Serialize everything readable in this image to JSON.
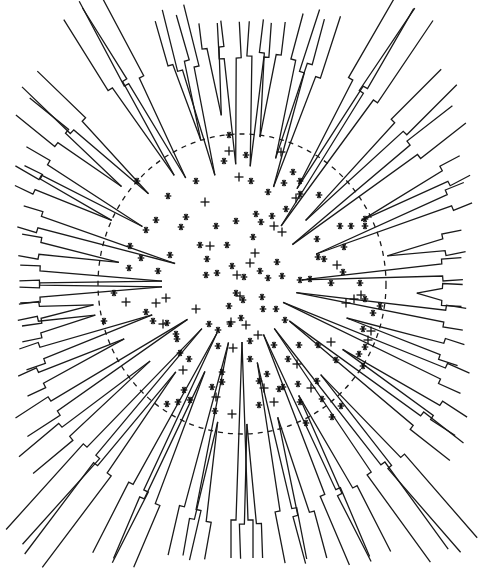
{
  "figure": {
    "width": 484,
    "height": 573,
    "background": "#ffffff",
    "ink": "#1a1a1a",
    "center": [
      242,
      284
    ],
    "dashed_circle": {
      "cx": 242,
      "cy": 284,
      "rx": 144,
      "ry": 150
    },
    "boundary": {
      "left": 20,
      "top": 22,
      "right": 462,
      "bottom": 558
    },
    "spoke_count": 36,
    "markers": {
      "star": [
        [
          229,
          135
        ],
        [
          224,
          161
        ],
        [
          196,
          181
        ],
        [
          168,
          196
        ],
        [
          186,
          217
        ],
        [
          181,
          227
        ],
        [
          137,
          181
        ],
        [
          146,
          230
        ],
        [
          130,
          246
        ],
        [
          216,
          226
        ],
        [
          227,
          245
        ],
        [
          236,
          221
        ],
        [
          256,
          214
        ],
        [
          251,
          181
        ],
        [
          246,
          155
        ],
        [
          284,
          183
        ],
        [
          300,
          181
        ],
        [
          293,
          172
        ],
        [
          268,
          192
        ],
        [
          253,
          237
        ],
        [
          261,
          222
        ],
        [
          272,
          216
        ],
        [
          300,
          194
        ],
        [
          319,
          195
        ],
        [
          286,
          209
        ],
        [
          317,
          239
        ],
        [
          318,
          257
        ],
        [
          340,
          226
        ],
        [
          344,
          247
        ],
        [
          365,
          226
        ],
        [
          365,
          219
        ],
        [
          351,
          226
        ],
        [
          300,
          280
        ],
        [
          310,
          279
        ],
        [
          282,
          276
        ],
        [
          277,
          262
        ],
        [
          268,
          278
        ],
        [
          260,
          271
        ],
        [
          206,
          275
        ],
        [
          217,
          273
        ],
        [
          232,
          266
        ],
        [
          207,
          259
        ],
        [
          200,
          245
        ],
        [
          156,
          220
        ],
        [
          170,
          255
        ],
        [
          158,
          271
        ],
        [
          141,
          258
        ],
        [
          129,
          268
        ],
        [
          104,
          321
        ],
        [
          114,
          293
        ],
        [
          146,
          312
        ],
        [
          167,
          323
        ],
        [
          177,
          339
        ],
        [
          189,
          359
        ],
        [
          184,
          390
        ],
        [
          190,
          400
        ],
        [
          178,
          402
        ],
        [
          167,
          404
        ],
        [
          212,
          387
        ],
        [
          215,
          411
        ],
        [
          222,
          382
        ],
        [
          222,
          372
        ],
        [
          218,
          346
        ],
        [
          230,
          324
        ],
        [
          243,
          300
        ],
        [
          236,
          293
        ],
        [
          229,
          306
        ],
        [
          244,
          277
        ],
        [
          262,
          297
        ],
        [
          263,
          309
        ],
        [
          276,
          309
        ],
        [
          285,
          320
        ],
        [
          274,
          345
        ],
        [
          288,
          359
        ],
        [
          299,
          345
        ],
        [
          298,
          384
        ],
        [
          283,
          387
        ],
        [
          259,
          405
        ],
        [
          259,
          381
        ],
        [
          267,
          374
        ],
        [
          250,
          341
        ],
        [
          250,
          359
        ],
        [
          241,
          318
        ],
        [
          218,
          330
        ],
        [
          209,
          324
        ],
        [
          176,
          334
        ],
        [
          180,
          353
        ],
        [
          153,
          321
        ],
        [
          331,
          283
        ],
        [
          324,
          259
        ],
        [
          343,
          272
        ],
        [
          360,
          283
        ],
        [
          380,
          306
        ],
        [
          373,
          313
        ],
        [
          365,
          299
        ],
        [
          363,
          329
        ],
        [
          365,
          347
        ],
        [
          363,
          366
        ],
        [
          359,
          354
        ],
        [
          336,
          360
        ],
        [
          318,
          345
        ],
        [
          317,
          381
        ],
        [
          341,
          406
        ],
        [
          332,
          417
        ],
        [
          306,
          423
        ],
        [
          322,
          399
        ],
        [
          300,
          402
        ],
        [
          279,
          389
        ]
      ],
      "plus": [
        [
          229,
          151
        ],
        [
          210,
          246
        ],
        [
          205,
          202
        ],
        [
          237,
          275
        ],
        [
          250,
          263
        ],
        [
          255,
          253
        ],
        [
          282,
          232
        ],
        [
          274,
          226
        ],
        [
          240,
          296
        ],
        [
          246,
          325
        ],
        [
          258,
          335
        ],
        [
          233,
          348
        ],
        [
          231,
          322
        ],
        [
          196,
          309
        ],
        [
          166,
          298
        ],
        [
          126,
          302
        ],
        [
          156,
          303
        ],
        [
          163,
          324
        ],
        [
          183,
          370
        ],
        [
          216,
          397
        ],
        [
          232,
          414
        ],
        [
          264,
          388
        ],
        [
          274,
          402
        ],
        [
          297,
          364
        ],
        [
          354,
          299
        ],
        [
          361,
          295
        ],
        [
          346,
          303
        ],
        [
          371,
          331
        ],
        [
          368,
          340
        ],
        [
          331,
          342
        ],
        [
          311,
          388
        ],
        [
          337,
          265
        ],
        [
          281,
          152
        ],
        [
          296,
          198
        ],
        [
          239,
          177
        ]
      ]
    },
    "spokes": [
      {
        "angle": -122,
        "tip": 128,
        "step": 235,
        "outer": [
          60,
          22
        ]
      },
      {
        "angle": -118,
        "tip": 120,
        "step": 230,
        "outer": [
          40,
          22
        ]
      },
      {
        "angle": -106,
        "tip": 150,
        "step": 230,
        "outer": [
          152,
          22
        ]
      },
      {
        "angle": -104,
        "tip": 112,
        "step": 222,
        "outer": [
          114,
          22
        ]
      },
      {
        "angle": -97,
        "tip": 170,
        "step": 238,
        "outer": [
          210,
          22
        ]
      },
      {
        "angle": -93,
        "tip": 120,
        "step": 226,
        "outer": [
          236,
          22
        ]
      },
      {
        "angle": -86,
        "tip": 118,
        "step": 228,
        "outer": [
          259,
          22
        ]
      },
      {
        "angle": -83,
        "tip": 148,
        "step": 232,
        "outer": [
          285,
          22
        ]
      },
      {
        "angle": -75,
        "tip": 130,
        "step": 230,
        "outer": [
          335,
          22
        ]
      },
      {
        "angle": -72,
        "tip": 102,
        "step": 220,
        "outer": [
          358,
          22
        ]
      },
      {
        "angle": -60,
        "tip": 110,
        "step": 232,
        "outer": [
          437,
          22
        ]
      },
      {
        "angle": -56,
        "tip": 70,
        "step": 226,
        "outer": [
          462,
          40
        ]
      },
      {
        "angle": -45,
        "tip": 90,
        "step": 222,
        "outer": [
          462,
          90
        ]
      },
      {
        "angle": -38,
        "tip": 64,
        "step": 218,
        "outer": [
          462,
          118
        ]
      },
      {
        "angle": -28,
        "tip": 135,
        "step": 230,
        "outer": [
          462,
          160
        ]
      },
      {
        "angle": -22,
        "tip": 80,
        "step": 226,
        "outer": [
          462,
          178
        ]
      },
      {
        "angle": -11,
        "tip": 148,
        "step": 232,
        "outer": [
          462,
          233
        ]
      },
      {
        "angle": -4,
        "tip": 60,
        "step": 226,
        "outer": [
          462,
          266
        ]
      },
      {
        "angle": 3,
        "tip": 175,
        "step": 230,
        "outer": [
          462,
          297
        ]
      },
      {
        "angle": 9,
        "tip": 55,
        "step": 224,
        "outer": [
          462,
          335
        ]
      },
      {
        "angle": 18,
        "tip": 110,
        "step": 230,
        "outer": [
          462,
          352
        ]
      },
      {
        "angle": 24,
        "tip": 45,
        "step": 220,
        "outer": [
          462,
          390
        ]
      },
      {
        "angle": 33,
        "tip": 120,
        "step": 232,
        "outer": [
          462,
          425
        ]
      },
      {
        "angle": 38,
        "tip": 60,
        "step": 222,
        "outer": [
          462,
          445
        ]
      },
      {
        "angle": 49,
        "tip": 120,
        "step": 235,
        "outer": [
          454,
          558
        ]
      },
      {
        "angle": 54,
        "tip": 55,
        "step": 228,
        "outer": [
          436,
          558
        ]
      },
      {
        "angle": 63,
        "tip": 125,
        "step": 232,
        "outer": [
          378,
          558
        ]
      },
      {
        "angle": 67,
        "tip": 55,
        "step": 226,
        "outer": [
          366,
          558
        ]
      },
      {
        "angle": 75,
        "tip": 138,
        "step": 238,
        "outer": [
          327,
          558
        ]
      },
      {
        "angle": 79,
        "tip": 80,
        "step": 230,
        "outer": [
          312,
          558
        ]
      },
      {
        "angle": 88,
        "tip": 140,
        "step": 240,
        "outer": [
          262,
          558
        ]
      },
      {
        "angle": 90,
        "tip": 58,
        "step": 236,
        "outer": [
          242,
          558
        ]
      },
      {
        "angle": 100,
        "tip": 140,
        "step": 240,
        "outer": [
          197,
          558
        ]
      },
      {
        "angle": 103,
        "tip": 60,
        "step": 230,
        "outer": [
          180,
          558
        ]
      },
      {
        "angle": 113,
        "tip": 95,
        "step": 236,
        "outer": [
          112,
          558
        ]
      },
      {
        "angle": 117,
        "tip": 55,
        "step": 228,
        "outer": [
          103,
          558
        ]
      },
      {
        "angle": 127,
        "tip": 110,
        "step": 232,
        "outer": [
          30,
          558
        ]
      },
      {
        "angle": 132,
        "tip": 60,
        "step": 225,
        "outer": [
          20,
          542
        ]
      },
      {
        "angle": 140,
        "tip": 120,
        "step": 230,
        "outer": [
          20,
          458
        ]
      },
      {
        "angle": 147,
        "tip": 65,
        "step": 224,
        "outer": [
          20,
          425
        ]
      },
      {
        "angle": 155,
        "tip": 130,
        "step": 230,
        "outer": [
          20,
          380
        ]
      },
      {
        "angle": 161,
        "tip": 95,
        "step": 226,
        "outer": [
          20,
          351
        ]
      },
      {
        "angle": 168,
        "tip": 150,
        "step": 232,
        "outer": [
          20,
          331
        ]
      },
      {
        "angle": 172,
        "tip": 150,
        "step": 228,
        "outer": [
          20,
          312
        ]
      },
      {
        "angle": 178,
        "tip": 80,
        "step": 230,
        "outer": [
          20,
          298
        ]
      },
      {
        "angle": -178,
        "tip": 80,
        "step": 226,
        "outer": [
          20,
          272
        ]
      },
      {
        "angle": -170,
        "tip": 125,
        "step": 230,
        "outer": [
          20,
          246
        ]
      },
      {
        "angle": -163,
        "tip": 70,
        "step": 224,
        "outer": [
          20,
          218
        ]
      },
      {
        "angle": -154,
        "tip": 145,
        "step": 232,
        "outer": [
          20,
          175
        ]
      },
      {
        "angle": -150,
        "tip": 115,
        "step": 228,
        "outer": [
          20,
          158
        ]
      },
      {
        "angle": -141,
        "tip": 155,
        "step": 232,
        "outer": [
          20,
          110
        ]
      },
      {
        "angle": -136,
        "tip": 130,
        "step": 228,
        "outer": [
          20,
          89
        ]
      }
    ]
  }
}
